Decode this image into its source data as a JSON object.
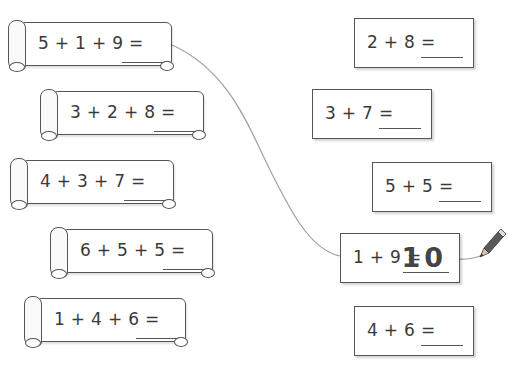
{
  "worksheet": {
    "left_equations": [
      {
        "expression": "5 + 1 + 9 =",
        "answer": ""
      },
      {
        "expression": "3 + 2 + 8 =",
        "answer": ""
      },
      {
        "expression": "4 + 3 + 7 =",
        "answer": ""
      },
      {
        "expression": "6 + 5 + 5 =",
        "answer": ""
      },
      {
        "expression": "1 + 4 + 6 =",
        "answer": ""
      }
    ],
    "right_equations": [
      {
        "expression": "2 + 8 =",
        "answer": ""
      },
      {
        "expression": "3 + 7 =",
        "answer": ""
      },
      {
        "expression": "5 + 5 =",
        "answer": ""
      },
      {
        "expression": "1 + 9 =",
        "answer": "10"
      },
      {
        "expression": "4 + 6 =",
        "answer": ""
      }
    ],
    "connection": {
      "from": "5 + 1 + 9 =",
      "to": "1 + 9 ="
    },
    "icons": {
      "pencil": "pencil-icon"
    },
    "colors": {
      "line": "#9a9a9a",
      "ink": "#3a3a3a",
      "pencil_body": "#5a5a5a"
    }
  }
}
